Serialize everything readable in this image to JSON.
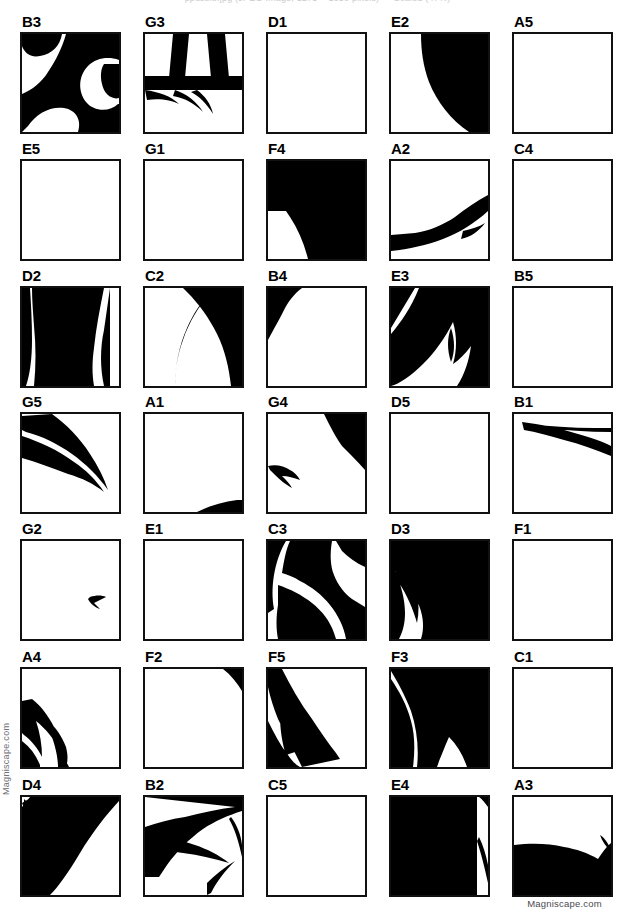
{
  "page": {
    "top_clipped_text": "ppuzzle.jpg (JPEG Image, 1275 × 1650 pixels) — Scaled (47%)",
    "watermark_left": "Magniscape.com",
    "watermark_bottom_right": "Magniscape.com"
  },
  "grid": {
    "columns": 5,
    "rows": 7,
    "cell_width": 99,
    "cell_height": 98,
    "border_color": "#111111",
    "fill_color": "#000000",
    "background_color": "#ffffff"
  },
  "tiles": [
    {
      "label": "B3",
      "col": 0,
      "row": 0,
      "coverage": "heavy"
    },
    {
      "label": "G3",
      "col": 1,
      "row": 0,
      "coverage": "heavy"
    },
    {
      "label": "D1",
      "col": 2,
      "row": 0,
      "coverage": "empty"
    },
    {
      "label": "E2",
      "col": 3,
      "row": 0,
      "coverage": "heavy"
    },
    {
      "label": "A5",
      "col": 4,
      "row": 0,
      "coverage": "empty"
    },
    {
      "label": "E5",
      "col": 0,
      "row": 1,
      "coverage": "empty"
    },
    {
      "label": "G1",
      "col": 1,
      "row": 1,
      "coverage": "empty"
    },
    {
      "label": "F4",
      "col": 2,
      "row": 1,
      "coverage": "heavy"
    },
    {
      "label": "A2",
      "col": 3,
      "row": 1,
      "coverage": "light"
    },
    {
      "label": "C4",
      "col": 4,
      "row": 1,
      "coverage": "empty"
    },
    {
      "label": "D2",
      "col": 0,
      "row": 2,
      "coverage": "heavy"
    },
    {
      "label": "C2",
      "col": 1,
      "row": 2,
      "coverage": "medium"
    },
    {
      "label": "B4",
      "col": 2,
      "row": 2,
      "coverage": "light"
    },
    {
      "label": "E3",
      "col": 3,
      "row": 2,
      "coverage": "heavy"
    },
    {
      "label": "B5",
      "col": 4,
      "row": 2,
      "coverage": "empty"
    },
    {
      "label": "G5",
      "col": 0,
      "row": 3,
      "coverage": "medium"
    },
    {
      "label": "A1",
      "col": 1,
      "row": 3,
      "coverage": "light"
    },
    {
      "label": "G4",
      "col": 2,
      "row": 3,
      "coverage": "medium"
    },
    {
      "label": "D5",
      "col": 3,
      "row": 3,
      "coverage": "empty"
    },
    {
      "label": "B1",
      "col": 4,
      "row": 3,
      "coverage": "light"
    },
    {
      "label": "G2",
      "col": 0,
      "row": 4,
      "coverage": "light"
    },
    {
      "label": "E1",
      "col": 1,
      "row": 4,
      "coverage": "empty"
    },
    {
      "label": "C3",
      "col": 2,
      "row": 4,
      "coverage": "heavy"
    },
    {
      "label": "D3",
      "col": 3,
      "row": 4,
      "coverage": "heavy"
    },
    {
      "label": "F1",
      "col": 4,
      "row": 4,
      "coverage": "empty"
    },
    {
      "label": "A4",
      "col": 0,
      "row": 5,
      "coverage": "medium"
    },
    {
      "label": "F2",
      "col": 1,
      "row": 5,
      "coverage": "light"
    },
    {
      "label": "F5",
      "col": 2,
      "row": 5,
      "coverage": "medium"
    },
    {
      "label": "F3",
      "col": 3,
      "row": 5,
      "coverage": "heavy"
    },
    {
      "label": "C1",
      "col": 4,
      "row": 5,
      "coverage": "empty"
    },
    {
      "label": "D4",
      "col": 0,
      "row": 6,
      "coverage": "heavy"
    },
    {
      "label": "B2",
      "col": 1,
      "row": 6,
      "coverage": "heavy"
    },
    {
      "label": "C5",
      "col": 2,
      "row": 6,
      "coverage": "empty"
    },
    {
      "label": "E4",
      "col": 3,
      "row": 6,
      "coverage": "heavy"
    },
    {
      "label": "A3",
      "col": 4,
      "row": 6,
      "coverage": "heavy"
    }
  ],
  "shapes": {
    "B3": "M0,0 L40,0 C38,12 30,20 18,22 C8,24 2,18 0,12 Z M44,0 L97,0 L97,26 C86,22 74,24 66,32 C56,42 56,58 64,68 C72,78 88,78 96,70 L97,70 L97,98 L56,98 C60,86 54,76 42,74 C28,72 14,80 6,92 L0,98 L0,60 C10,56 20,48 26,38 C34,26 40,14 44,0 Z M82,30 L97,30 L97,64 C90,66 82,60 80,50 C78,42 79,34 82,30 Z",
    "G3": "M0,42 L97,42 L97,56 L0,56 Z M28,0 L44,0 L40,44 L24,44 Z M62,0 L80,0 L84,44 L66,44 Z M0,56 C14,58 26,62 34,70 C26,66 14,64 2,66 Z M30,56 C42,60 52,68 58,78 C50,70 40,64 28,62 Z M52,56 C60,62 66,70 68,80 C62,70 54,62 46,58 Z",
    "D1": "",
    "E2": "M30,0 L97,0 L97,98 L78,98 C60,86 46,68 38,48 C32,32 30,16 30,0 Z",
    "A5": "",
    "E5": "",
    "G1": "",
    "F4": "M0,0 L97,0 L97,98 L40,98 C36,82 30,68 22,56 L18,50 L0,50 Z M6,12 C18,18 30,28 38,40 C28,30 16,22 4,18 Z M10,26 C22,32 32,40 40,50 C30,42 18,34 8,30 Z",
    "A2": "M97,34 C86,40 74,48 64,56 C52,64 38,70 24,72 L0,74 L0,90 C18,88 36,84 52,78 C68,72 84,62 97,50 Z M72,70 C80,68 88,66 94,62 C88,70 80,76 70,78 Z",
    "C4": "",
    "D2": "M10,0 L88,0 L88,98 L82,98 C78,80 78,60 82,42 C84,28 86,14 88,0 L82,0 C78,20 74,40 72,60 C70,74 70,86 72,98 L12,98 C14,78 14,58 12,38 C11,24 10,12 10,0 Z M0,0 L8,0 C9,16 10,34 10,52 C10,70 8,86 4,98 L0,98 Z",
    "C2": "M66,0 L97,0 L97,98 L86,98 C84,80 80,62 72,46 C64,30 54,16 42,4 L38,0 Z M97,84 L97,98 L92,98 C93,92 95,88 97,84 Z M30,98 C30,78 34,58 42,40 C48,26 56,14 66,4 C54,18 44,34 38,52 C32,68 30,84 30,98 Z",
    "B4": "M0,0 L34,0 C26,6 20,14 16,22 C10,34 4,44 0,52 Z M8,2 C14,4 20,6 24,10 C18,8 12,6 6,6 Z",
    "E3": "M0,0 L24,0 L0,40 Z M28,0 L97,0 L97,98 L66,98 C74,86 78,72 80,58 C74,66 68,72 62,76 C66,62 66,48 62,34 C54,50 44,64 32,76 C20,88 8,96 0,98 L0,46 C10,34 20,20 28,0 Z M60,40 C64,52 64,64 60,74 C56,62 56,50 60,40 Z",
    "B5": "",
    "G5": "M0,2 L30,0 C44,10 58,24 68,40 C76,52 82,64 86,76 C76,62 64,50 50,40 C36,30 20,22 4,18 L0,16 Z M0,22 C18,28 36,36 52,48 C64,56 74,66 82,78 C72,70 60,64 46,60 C30,54 14,48 0,44 Z",
    "A1": "M52,98 C64,92 78,88 92,86 L97,86 L97,98 Z",
    "G4": "M56,0 L97,0 L97,56 C90,48 82,40 74,32 C68,24 62,12 56,0 Z M0,52 C8,50 16,52 22,56 C26,58 30,62 32,66 C26,64 20,62 14,62 C18,66 22,70 24,74 C16,70 8,62 2,56 Z",
    "D5": "",
    "B1": "M8,8 C26,10 46,14 64,20 C78,24 90,28 97,32 L97,42 C82,36 66,30 50,26 C36,22 22,18 10,16 Z M12,10 C34,12 58,14 80,14 L97,14 L97,18 C74,18 50,16 28,14 Z",
    "G2": "M68,56 C74,54 80,54 84,56 C80,58 76,60 72,62 C74,64 76,66 78,68 C72,66 68,62 66,58 Z",
    "E1": "",
    "C3": "M0,0 L18,0 C12,10 8,22 6,34 C4,46 4,58 6,68 L0,72 Z M22,0 L64,0 C62,12 62,24 66,34 C70,44 76,52 84,58 L97,66 L97,98 L78,98 C76,86 70,74 62,64 C54,54 44,46 32,40 C26,36 20,34 14,32 C16,20 18,8 22,0 Z M68,0 L97,0 L97,26 C88,22 80,16 74,10 Z M10,44 C22,48 34,54 44,62 C54,70 62,80 66,92 L68,98 L10,98 C8,88 8,76 10,64 Z",
    "D3": "M22,0 L97,0 L97,98 L30,98 C34,86 32,72 26,60 C20,48 12,38 4,30 C10,44 14,58 14,72 C14,82 12,90 8,98 L0,98 L0,0 Z M6,10 C14,22 22,36 26,52 C28,62 28,72 26,82 C22,68 16,54 8,42 C4,34 2,22 6,10 Z",
    "F1": "",
    "A4": "M10,30 C18,36 26,46 32,58 C36,66 38,74 38,82 C32,70 24,60 14,52 C18,64 20,76 20,88 C16,80 10,72 2,66 L0,64 L0,32 Z M0,72 C8,78 14,86 18,96 L18,98 L0,98 Z M26,52 C34,58 40,68 44,78 C46,86 46,92 44,98 L36,98 C36,86 32,72 26,58 Z M40,88 C44,92 46,96 47,98 L42,98 C42,94 41,90 40,88 Z",
    "F2": "M78,0 L97,0 L97,22 C92,14 86,6 78,0 Z",
    "F5": "M0,0 L14,0 C22,16 32,34 44,50 C52,62 60,74 68,84 L72,90 L34,98 C26,82 18,66 10,50 C6,40 2,28 0,18 Z M0,52 C6,64 12,76 20,86 C24,92 28,96 32,98 L0,98 Z M12,46 C20,58 28,70 36,80 C30,82 24,84 18,86 C14,74 12,60 12,46 Z",
    "F3": "M0,0 L97,0 L97,98 L76,98 C72,86 66,76 58,68 C52,82 48,92 46,98 L26,98 C28,80 26,60 20,42 C14,26 6,12 0,2 Z M84,0 L97,0 L97,16 C92,10 88,4 84,0 Z M0,10 C8,22 16,36 20,52 C24,66 24,82 22,98 L0,98 Z",
    "C1": "",
    "D4": "M8,0 L97,0 L97,4 C84,18 70,36 58,56 C46,76 36,90 28,98 L0,98 L0,10 Z M2,2 C10,10 18,20 24,32 C18,26 10,20 2,16 Z M10,0 C20,10 28,22 34,36 C28,46 22,56 18,66 C14,46 8,24 0,6 Z",
    "B2": "M0,0 L97,0 L97,14 C84,18 70,24 58,32 C44,42 32,54 22,68 L14,80 L0,80 L0,30 C12,26 26,22 40,20 C56,16 74,12 90,10 Z M0,36 C16,38 34,42 50,48 C62,52 74,58 84,66 C70,62 54,58 38,56 C24,54 10,52 0,52 Z M76,0 L97,0 L97,10 C90,8 82,4 76,0 Z M62,86 C70,78 80,70 90,64 C80,74 72,84 66,96 L62,98 Z M86,20 C92,28 96,38 97,48 L97,60 C94,46 90,32 84,22 Z",
    "C5": "",
    "E4": "M0,0 L86,0 L86,98 L0,98 Z M88,0 L97,0 L97,10 C94,6 91,2 88,0 Z M88,40 C92,48 95,58 97,68 L97,86 C94,72 90,56 86,44 Z M0,88 C6,90 12,94 16,98 L0,98 Z",
    "A3": "M0,48 C16,46 34,46 50,50 C62,52 74,56 84,62 C88,56 92,50 97,46 L97,98 L0,98 Z M86,38 C92,42 95,48 97,54 C92,50 88,44 86,38 Z M0,72 C12,70 24,74 32,84 C36,90 38,94 38,98 L28,98 C26,90 20,84 12,82 C8,80 4,80 0,80 Z M84,78 C90,82 94,88 96,94 L97,98 L88,98 C88,90 86,84 84,78 Z"
  }
}
